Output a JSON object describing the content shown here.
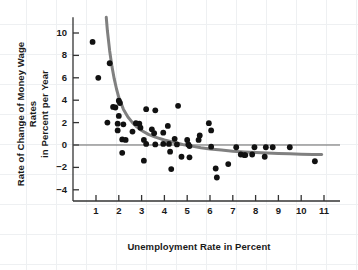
{
  "chart_data": {
    "type": "scatter",
    "title": "",
    "xlabel": "Unemployment Rate in Percent",
    "ylabel": "Rate of Change of Money Wage Rates in Percent per Year",
    "ylabel_line1": "Rate of Change of Money Wage Rates",
    "ylabel_line2": "in Percent per Year",
    "xlim": [
      0.3,
      11.6
    ],
    "ylim": [
      -5.2,
      11.4
    ],
    "xticks": [
      1,
      2,
      3,
      4,
      5,
      6,
      7,
      8,
      9,
      10,
      11
    ],
    "yticks": [
      10,
      8,
      6,
      4,
      2,
      0,
      -2,
      -4
    ],
    "grid": "faint graph paper background",
    "legend": "none",
    "zero_line": 0,
    "marker_color": "#111111",
    "curve_color": "#808080",
    "axis_color": "#333333",
    "points": [
      {
        "x": 0.85,
        "y": 9.2
      },
      {
        "x": 1.1,
        "y": 6.0
      },
      {
        "x": 1.6,
        "y": 7.3
      },
      {
        "x": 1.5,
        "y": 2.0
      },
      {
        "x": 1.75,
        "y": 3.4
      },
      {
        "x": 1.85,
        "y": 3.35
      },
      {
        "x": 2.0,
        "y": 3.95
      },
      {
        "x": 2.05,
        "y": 3.75
      },
      {
        "x": 2.0,
        "y": 2.6
      },
      {
        "x": 1.95,
        "y": 1.9
      },
      {
        "x": 1.95,
        "y": 1.3
      },
      {
        "x": 2.2,
        "y": 1.85
      },
      {
        "x": 2.15,
        "y": 0.5
      },
      {
        "x": 2.3,
        "y": 0.45
      },
      {
        "x": 2.15,
        "y": -0.7
      },
      {
        "x": 2.6,
        "y": 1.2
      },
      {
        "x": 2.75,
        "y": 1.95
      },
      {
        "x": 2.9,
        "y": 1.9
      },
      {
        "x": 2.95,
        "y": 1.55
      },
      {
        "x": 3.2,
        "y": 3.2
      },
      {
        "x": 3.1,
        "y": 0.45
      },
      {
        "x": 3.2,
        "y": 0.1
      },
      {
        "x": 3.1,
        "y": -1.4
      },
      {
        "x": 3.45,
        "y": 1.4
      },
      {
        "x": 3.55,
        "y": 1.05
      },
      {
        "x": 3.6,
        "y": 3.1
      },
      {
        "x": 3.6,
        "y": 0.05
      },
      {
        "x": 3.95,
        "y": 1.1
      },
      {
        "x": 3.95,
        "y": 0.1
      },
      {
        "x": 4.15,
        "y": 1.7
      },
      {
        "x": 4.2,
        "y": 0.1
      },
      {
        "x": 4.25,
        "y": -0.6
      },
      {
        "x": 4.3,
        "y": -2.15
      },
      {
        "x": 4.6,
        "y": 3.5
      },
      {
        "x": 4.45,
        "y": 0.55
      },
      {
        "x": 4.55,
        "y": 0.05
      },
      {
        "x": 4.75,
        "y": -1.05
      },
      {
        "x": 5.0,
        "y": 0.45
      },
      {
        "x": 5.05,
        "y": 0.05
      },
      {
        "x": 5.1,
        "y": -0.1
      },
      {
        "x": 5.1,
        "y": -1.1
      },
      {
        "x": 5.55,
        "y": 0.85
      },
      {
        "x": 5.5,
        "y": 0.45
      },
      {
        "x": 5.95,
        "y": 1.95
      },
      {
        "x": 6.05,
        "y": 1.3
      },
      {
        "x": 6.05,
        "y": -0.15
      },
      {
        "x": 6.25,
        "y": -2.1
      },
      {
        "x": 6.3,
        "y": -2.9
      },
      {
        "x": 6.8,
        "y": -1.7
      },
      {
        "x": 7.15,
        "y": -0.2
      },
      {
        "x": 7.35,
        "y": -0.85
      },
      {
        "x": 7.5,
        "y": -0.9
      },
      {
        "x": 7.55,
        "y": -0.9
      },
      {
        "x": 7.85,
        "y": -0.85
      },
      {
        "x": 7.95,
        "y": -0.2
      },
      {
        "x": 8.45,
        "y": -0.2
      },
      {
        "x": 8.4,
        "y": -1.05
      },
      {
        "x": 8.75,
        "y": -0.2
      },
      {
        "x": 9.5,
        "y": -0.2
      },
      {
        "x": 10.6,
        "y": -1.45
      }
    ],
    "fitted_curve": {
      "description": "Phillips curve: hyperbolic fit of wage change on unemployment",
      "color": "#808080",
      "points": [
        {
          "x": 1.45,
          "y": 11.4
        },
        {
          "x": 1.5,
          "y": 10.2
        },
        {
          "x": 1.6,
          "y": 8.4
        },
        {
          "x": 1.7,
          "y": 7.0
        },
        {
          "x": 1.8,
          "y": 5.9
        },
        {
          "x": 1.9,
          "y": 5.0
        },
        {
          "x": 2.0,
          "y": 4.25
        },
        {
          "x": 2.2,
          "y": 3.2
        },
        {
          "x": 2.4,
          "y": 2.5
        },
        {
          "x": 2.6,
          "y": 2.0
        },
        {
          "x": 2.8,
          "y": 1.6
        },
        {
          "x": 3.0,
          "y": 1.3
        },
        {
          "x": 3.3,
          "y": 0.95
        },
        {
          "x": 3.6,
          "y": 0.7
        },
        {
          "x": 4.0,
          "y": 0.45
        },
        {
          "x": 4.4,
          "y": 0.25
        },
        {
          "x": 4.8,
          "y": 0.05
        },
        {
          "x": 5.2,
          "y": -0.1
        },
        {
          "x": 5.6,
          "y": -0.25
        },
        {
          "x": 6.0,
          "y": -0.35
        },
        {
          "x": 6.5,
          "y": -0.45
        },
        {
          "x": 7.0,
          "y": -0.55
        },
        {
          "x": 7.5,
          "y": -0.62
        },
        {
          "x": 8.0,
          "y": -0.68
        },
        {
          "x": 8.5,
          "y": -0.72
        },
        {
          "x": 9.0,
          "y": -0.76
        },
        {
          "x": 9.5,
          "y": -0.79
        },
        {
          "x": 10.0,
          "y": -0.82
        },
        {
          "x": 10.5,
          "y": -0.84
        },
        {
          "x": 10.9,
          "y": -0.85
        }
      ]
    }
  }
}
